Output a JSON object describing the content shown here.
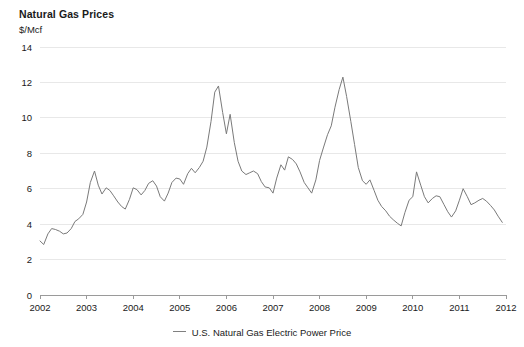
{
  "chart_data": {
    "type": "line",
    "title": "Natural Gas Prices",
    "subtitle": "$/Mcf",
    "ylabel": "$/Mcf",
    "xlabel": "",
    "ylim": [
      0,
      14
    ],
    "xlim": [
      2002,
      2012
    ],
    "grid": true,
    "legend_position": "bottom",
    "yticks": [
      0,
      2,
      4,
      6,
      8,
      10,
      12,
      14
    ],
    "ytick_labels": [
      "0",
      "2",
      "4",
      "6",
      "8",
      "10",
      "12",
      "14"
    ],
    "xticks": [
      2002,
      2003,
      2004,
      2005,
      2006,
      2007,
      2008,
      2009,
      2010,
      2011,
      2012
    ],
    "xtick_labels": [
      "2002",
      "2003",
      "2004",
      "2005",
      "2006",
      "2007",
      "2008",
      "2009",
      "2010",
      "2011",
      "2012"
    ],
    "line_color": "#7a7a7a",
    "grid_color": "#e8e8e8",
    "axis_color": "#9a9a9a",
    "series": [
      {
        "name": "U.S. Natural Gas Electric Power Price",
        "color": "#7a7a7a",
        "x": [
          2002.0,
          2002.08,
          2002.17,
          2002.25,
          2002.33,
          2002.42,
          2002.5,
          2002.58,
          2002.67,
          2002.75,
          2002.83,
          2002.92,
          2003.0,
          2003.08,
          2003.17,
          2003.25,
          2003.33,
          2003.42,
          2003.5,
          2003.58,
          2003.67,
          2003.75,
          2003.83,
          2003.92,
          2004.0,
          2004.08,
          2004.17,
          2004.25,
          2004.33,
          2004.42,
          2004.5,
          2004.58,
          2004.67,
          2004.75,
          2004.83,
          2004.92,
          2005.0,
          2005.08,
          2005.17,
          2005.25,
          2005.33,
          2005.42,
          2005.5,
          2005.58,
          2005.67,
          2005.75,
          2005.83,
          2005.92,
          2006.0,
          2006.08,
          2006.17,
          2006.25,
          2006.33,
          2006.42,
          2006.5,
          2006.58,
          2006.67,
          2006.75,
          2006.83,
          2006.92,
          2007.0,
          2007.08,
          2007.17,
          2007.25,
          2007.33,
          2007.42,
          2007.5,
          2007.58,
          2007.67,
          2007.75,
          2007.83,
          2007.92,
          2008.0,
          2008.08,
          2008.17,
          2008.25,
          2008.33,
          2008.42,
          2008.5,
          2008.58,
          2008.67,
          2008.75,
          2008.83,
          2008.92,
          2009.0,
          2009.08,
          2009.17,
          2009.25,
          2009.33,
          2009.42,
          2009.5,
          2009.58,
          2009.67,
          2009.75,
          2009.83,
          2009.92,
          2010.0,
          2010.08,
          2010.17,
          2010.25,
          2010.33,
          2010.42,
          2010.5,
          2010.58,
          2010.67,
          2010.75,
          2010.83,
          2010.92,
          2011.0,
          2011.08,
          2011.17,
          2011.25,
          2011.33,
          2011.42,
          2011.5,
          2011.58,
          2011.67,
          2011.75,
          2011.83,
          2011.92
        ],
        "values": [
          3.05,
          2.85,
          3.45,
          3.75,
          3.7,
          3.6,
          3.45,
          3.5,
          3.75,
          4.15,
          4.3,
          4.55,
          5.25,
          6.35,
          7.0,
          6.2,
          5.7,
          6.05,
          5.9,
          5.6,
          5.25,
          5.0,
          4.85,
          5.4,
          6.05,
          5.95,
          5.65,
          5.9,
          6.3,
          6.45,
          6.15,
          5.55,
          5.3,
          5.75,
          6.35,
          6.6,
          6.55,
          6.25,
          6.85,
          7.15,
          6.9,
          7.2,
          7.55,
          8.35,
          9.8,
          11.45,
          11.8,
          10.3,
          9.1,
          10.2,
          8.6,
          7.55,
          7.0,
          6.8,
          6.9,
          7.0,
          6.85,
          6.4,
          6.1,
          6.05,
          5.75,
          6.6,
          7.35,
          7.05,
          7.8,
          7.65,
          7.4,
          6.95,
          6.35,
          6.05,
          5.75,
          6.5,
          7.6,
          8.3,
          9.05,
          9.55,
          10.6,
          11.6,
          12.3,
          11.2,
          9.8,
          8.5,
          7.2,
          6.45,
          6.25,
          6.5,
          5.9,
          5.35,
          5.0,
          4.75,
          4.45,
          4.25,
          4.05,
          3.9,
          4.65,
          5.35,
          5.55,
          6.95,
          6.2,
          5.55,
          5.2,
          5.45,
          5.6,
          5.55,
          5.1,
          4.7,
          4.4,
          4.75,
          5.35,
          6.0,
          5.55,
          5.1,
          5.2,
          5.35,
          5.45,
          5.3,
          5.05,
          4.8,
          4.45,
          4.1
        ]
      }
    ]
  },
  "legend": {
    "label": "U.S. Natural Gas Electric Power Price"
  }
}
